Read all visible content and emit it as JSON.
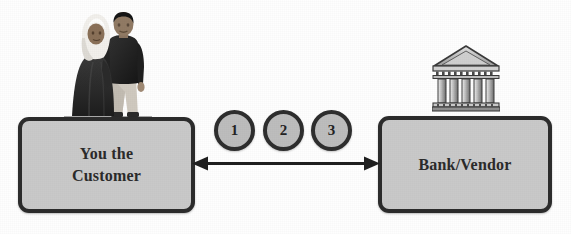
{
  "diagram": {
    "background_color": "#fefefe",
    "nodes": [
      {
        "id": "customer",
        "label": "You the\nCustomer",
        "fill_color": "#c9c9c9",
        "border_color": "#2c2c2c",
        "icon": "two-people-illustration"
      },
      {
        "id": "bank",
        "label": "Bank/Vendor",
        "fill_color": "#c9c9c9",
        "border_color": "#2c2c2c",
        "icon": "bank-building-illustration"
      }
    ],
    "connector": {
      "type": "double-headed-arrow",
      "color": "#1e1e1e",
      "from": "customer",
      "to": "bank"
    },
    "steps": [
      {
        "id": "step-1",
        "label": "1",
        "fill_color": "#bdbdbd",
        "border_color": "#2e2e2e"
      },
      {
        "id": "step-2",
        "label": "2",
        "fill_color": "#bdbdbd",
        "border_color": "#2e2e2e"
      },
      {
        "id": "step-3",
        "label": "3",
        "fill_color": "#bdbdbd",
        "border_color": "#2e2e2e"
      }
    ],
    "icons": {
      "customers": "two-people-illustration",
      "bank": "bank-building-illustration"
    }
  }
}
